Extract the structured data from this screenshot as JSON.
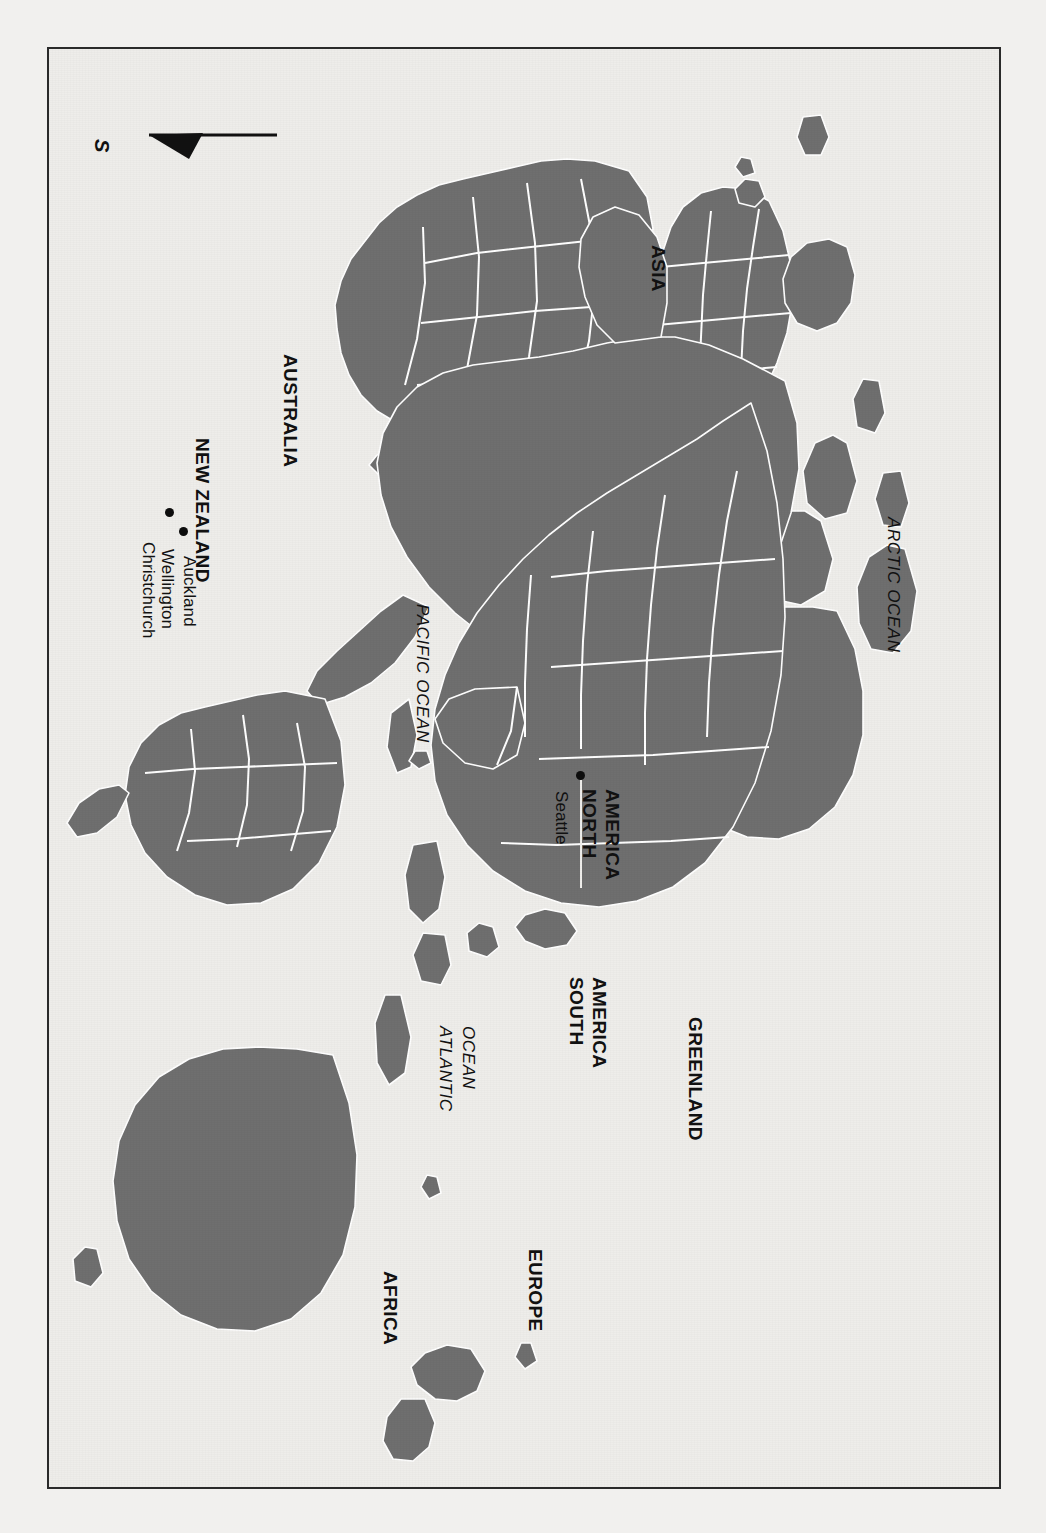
{
  "page": {
    "background_color": "#ffffff",
    "paper_color": "#f1f0ee",
    "frame_color": "#2a2a2a",
    "land_color": "#6f6f6f",
    "border_color": "#ffffff",
    "ocean_color": "#eeedea",
    "text_color": "#111111",
    "orientation_note": "map rendered rotated 90 degrees; north points right"
  },
  "compass": {
    "icon": "compass-arrow-icon",
    "direction_label": "S"
  },
  "continents": [
    {
      "label": "ASIA",
      "style": "bold"
    },
    {
      "label": "AUSTRALIA",
      "style": "bold"
    },
    {
      "label": "NORTH",
      "style": "bold"
    },
    {
      "label": "AMERICA",
      "style": "bold"
    },
    {
      "label": "SOUTH",
      "style": "bold"
    },
    {
      "label": "AMERICA",
      "style": "bold"
    },
    {
      "label": "AFRICA",
      "style": "bold"
    },
    {
      "label": "EUROPE",
      "style": "bold"
    },
    {
      "label": "GREENLAND",
      "style": "bold"
    }
  ],
  "labels": {
    "asia": "ASIA",
    "australia": "AUSTRALIA",
    "new_zealand": "NEW ZEALAND",
    "north_america_line1": "NORTH",
    "north_america_line2": "AMERICA",
    "south_america_line1": "SOUTH",
    "south_america_line2": "AMERICA",
    "greenland": "GREENLAND",
    "africa": "AFRICA",
    "europe": "EUROPE",
    "pacific_ocean": "PACIFIC OCEAN",
    "arctic_ocean": "ARCTIC OCEAN",
    "atlantic_ocean_line1": "ATLANTIC",
    "atlantic_ocean_line2": "OCEAN"
  },
  "cities": [
    {
      "name": "Christchurch",
      "country": "New Zealand"
    },
    {
      "name": "Wellington",
      "country": "New Zealand"
    },
    {
      "name": "Auckland",
      "country": "New Zealand"
    },
    {
      "name": "Seattle",
      "country": "North America"
    }
  ],
  "city_labels": {
    "christchurch": "Christchurch",
    "wellington": "Wellington",
    "auckland": "Auckland",
    "seattle": "Seattle"
  },
  "oceans": [
    {
      "label": "PACIFIC OCEAN",
      "style": "italic"
    },
    {
      "label": "ATLANTIC OCEAN",
      "style": "italic"
    },
    {
      "label": "ARCTIC OCEAN",
      "style": "italic"
    }
  ]
}
